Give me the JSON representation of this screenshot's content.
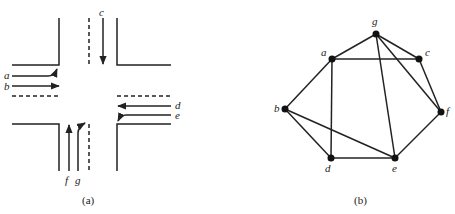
{
  "figure": {
    "panel_a": {
      "caption": "(a)",
      "description": "Road intersection with traffic streams",
      "streams": [
        {
          "id": "a",
          "label": "a",
          "movement": "west approach, turning left/north"
        },
        {
          "id": "b",
          "label": "b",
          "movement": "west approach, straight east"
        },
        {
          "id": "c",
          "label": "c",
          "movement": "north approach, straight south"
        },
        {
          "id": "d",
          "label": "d",
          "movement": "east approach, straight west"
        },
        {
          "id": "e",
          "label": "e",
          "movement": "east approach, turning"
        },
        {
          "id": "f",
          "label": "f",
          "movement": "south approach, straight north"
        },
        {
          "id": "g",
          "label": "g",
          "movement": "south approach, turning"
        }
      ]
    },
    "panel_b": {
      "caption": "(b)",
      "description": "Compatibility graph of traffic streams",
      "nodes": [
        {
          "id": "g",
          "label": "g",
          "x": 376,
          "y": 34
        },
        {
          "id": "a",
          "label": "a",
          "x": 332,
          "y": 59
        },
        {
          "id": "c",
          "label": "c",
          "x": 419,
          "y": 59
        },
        {
          "id": "b",
          "label": "b",
          "x": 285,
          "y": 109
        },
        {
          "id": "f",
          "label": "f",
          "x": 441,
          "y": 112
        },
        {
          "id": "d",
          "label": "d",
          "x": 331,
          "y": 158
        },
        {
          "id": "e",
          "label": "e",
          "x": 395,
          "y": 158
        }
      ],
      "edges": [
        [
          "g",
          "a"
        ],
        [
          "g",
          "c"
        ],
        [
          "g",
          "f"
        ],
        [
          "g",
          "e"
        ],
        [
          "a",
          "c"
        ],
        [
          "a",
          "b"
        ],
        [
          "a",
          "d"
        ],
        [
          "c",
          "f"
        ],
        [
          "b",
          "d"
        ],
        [
          "b",
          "e"
        ],
        [
          "d",
          "e"
        ],
        [
          "e",
          "f"
        ]
      ]
    }
  }
}
